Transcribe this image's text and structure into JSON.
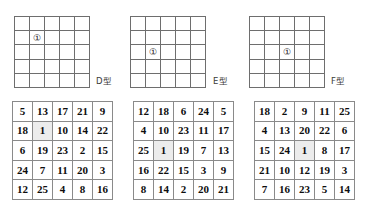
{
  "figure": {
    "marker_glyph": "①",
    "grid_line_color": "#6e6e6e",
    "number_grid_line_color": "#8a8a8a",
    "highlight_color": "#ececec",
    "text_color": "#0d0d0d"
  },
  "shapes": [
    {
      "label": "D型",
      "marker": "①",
      "marker_row": 2,
      "marker_col": 2,
      "rows": 5,
      "cols": 5
    },
    {
      "label": "E型",
      "marker": "①",
      "marker_row": 3,
      "marker_col": 2,
      "rows": 5,
      "cols": 5
    },
    {
      "label": "F型",
      "marker": "①",
      "marker_row": 3,
      "marker_col": 3,
      "rows": 5,
      "cols": 5
    }
  ],
  "number_grids": [
    {
      "name": "number-grid-d",
      "rows": [
        [
          "5",
          "13",
          "17",
          "21",
          "9"
        ],
        [
          "18",
          "1",
          "10",
          "14",
          "22"
        ],
        [
          "6",
          "19",
          "23",
          "2",
          "15"
        ],
        [
          "24",
          "7",
          "11",
          "20",
          "3"
        ],
        [
          "12",
          "25",
          "4",
          "8",
          "16"
        ]
      ],
      "highlight_row": 2,
      "highlight_col": 2
    },
    {
      "name": "number-grid-e",
      "rows": [
        [
          "12",
          "18",
          "6",
          "24",
          "5"
        ],
        [
          "4",
          "10",
          "23",
          "11",
          "17"
        ],
        [
          "25",
          "1",
          "19",
          "7",
          "13"
        ],
        [
          "16",
          "22",
          "15",
          "3",
          "9"
        ],
        [
          "8",
          "14",
          "2",
          "20",
          "21"
        ]
      ],
      "highlight_row": 3,
      "highlight_col": 2
    },
    {
      "name": "number-grid-f",
      "rows": [
        [
          "18",
          "2",
          "9",
          "11",
          "25"
        ],
        [
          "4",
          "13",
          "20",
          "22",
          "6"
        ],
        [
          "15",
          "24",
          "1",
          "8",
          "17"
        ],
        [
          "21",
          "10",
          "12",
          "19",
          "3"
        ],
        [
          "7",
          "16",
          "23",
          "5",
          "14"
        ]
      ],
      "highlight_row": 3,
      "highlight_col": 3
    }
  ],
  "layout": {
    "blank_grids": [
      {
        "left": 14,
        "top": 16,
        "width": 76,
        "height": 72
      },
      {
        "left": 130,
        "top": 16,
        "width": 76,
        "height": 72
      },
      {
        "left": 249,
        "top": 16,
        "width": 76,
        "height": 72
      }
    ],
    "shape_labels": [
      {
        "left": 96,
        "top": 74
      },
      {
        "left": 213,
        "top": 74
      },
      {
        "left": 331,
        "top": 74
      }
    ],
    "number_grids": [
      {
        "left": 12,
        "top": 101,
        "width": 101,
        "height": 99
      },
      {
        "left": 133,
        "top": 101,
        "width": 101,
        "height": 99
      },
      {
        "left": 254,
        "top": 101,
        "width": 101,
        "height": 99
      }
    ]
  }
}
